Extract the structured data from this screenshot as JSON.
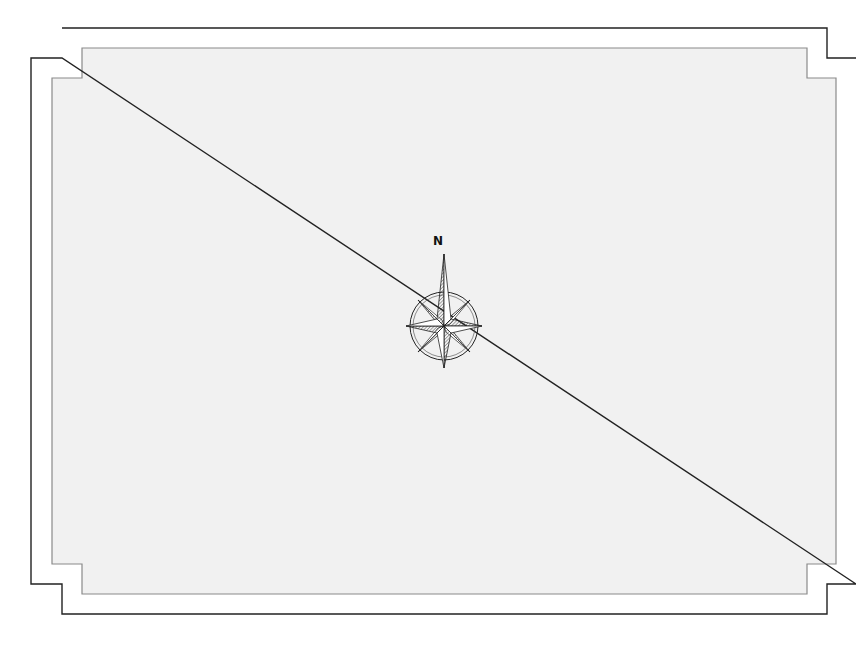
{
  "map": {
    "background_color": "#f2f2f2",
    "frame_color": "#333333",
    "inner_border_color": "#888888",
    "north_arrow": {
      "label": "N",
      "icon": "compass-rose-icon"
    }
  }
}
